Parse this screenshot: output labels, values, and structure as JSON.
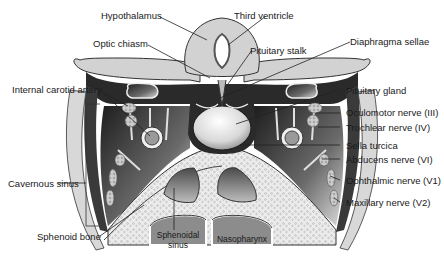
{
  "figure": {
    "colors": {
      "background": "#ffffff",
      "outline": "#2b2b2b",
      "dura_dark": "#2a2a2a",
      "brain_gray": "#cfcfcf",
      "bone_light": "#e6e6e6",
      "sinus_gray": "#8a8a8a",
      "label_text": "#1a1a1a"
    }
  },
  "labels": {
    "hypothalamus": "Hypothalamus",
    "third_ventricle": "Third ventricle",
    "optic_chiasm": "Optic chiasm",
    "pituitary_stalk": "Pituitary stalk",
    "diaphragma_sellae": "Diaphragma sellae",
    "internal_carotid_artery": "Internal carotid artery",
    "pituitary_gland": "Pituitary gland",
    "oculomotor_nerve": "Oculomotor nerve (III)",
    "trochlear_nerve": "Trochlear nerve (IV)",
    "cavernous_sinus": "Cavernous sinus",
    "sella_turcica": "Sella turcica",
    "abducens_nerve": "Abducens nerve (VI)",
    "ophthalmic_nerve": "Ophthalmic nerve (V1)",
    "maxillary_nerve": "Maxillary nerve (V2)",
    "sphenoid_bone": "Sphenoid bone",
    "sphenoidal_sinus_1": "Sphenoidal",
    "sphenoidal_sinus_2": "sinus",
    "nasopharynx": "Nasopharynx"
  }
}
